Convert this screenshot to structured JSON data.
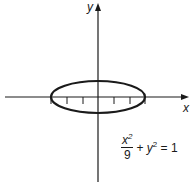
{
  "diagram": {
    "type": "ellipse-on-coordinate-axes",
    "axes": {
      "x_label": "x",
      "y_label": "y",
      "color": "#1a1a1a"
    },
    "ellipse": {
      "equation_display": {
        "numerator_var": "x",
        "numerator_exp": "2",
        "denominator": "9",
        "plus": "+",
        "term2_var": "y",
        "term2_exp": "2",
        "equals": "=",
        "rhs": "1"
      },
      "semi_major_axis": 3,
      "semi_minor_axis": 1,
      "center": [
        0,
        0
      ],
      "stroke_color": "#1a1a1a"
    },
    "x_ticks": [
      -3,
      -2,
      -1,
      1,
      2,
      3
    ]
  }
}
